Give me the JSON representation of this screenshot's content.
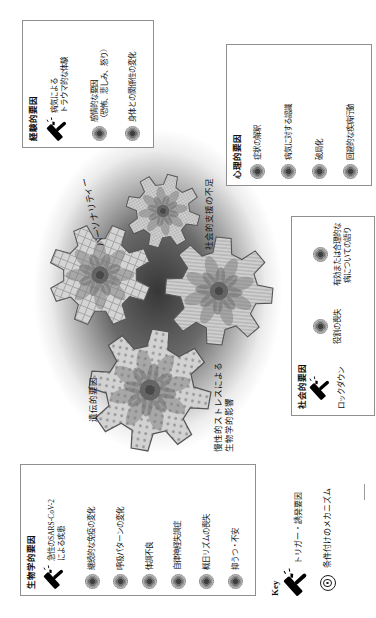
{
  "figure": {
    "boxes": {
      "biological": {
        "title": "生物学的要因",
        "items": [
          {
            "icon": "hammer",
            "lines": [
              "急性のSARS-CoV-2",
              "による疾患"
            ]
          },
          {
            "icon": "mechanism",
            "lines": [
              "継続的な免疫の変化"
            ]
          },
          {
            "icon": "mechanism",
            "lines": [
              "呼吸パターンの変化"
            ]
          },
          {
            "icon": "mechanism",
            "lines": [
              "体調不良"
            ]
          },
          {
            "icon": "mechanism",
            "lines": [
              "自律神経失調症"
            ]
          },
          {
            "icon": "mechanism",
            "lines": [
              "概日リズムの喪失"
            ]
          },
          {
            "icon": "mechanism",
            "lines": [
              "抑うつ・不安"
            ]
          }
        ]
      },
      "experiential": {
        "title": "経験的要因",
        "items": [
          {
            "icon": "hammer",
            "lines": [
              "病気による",
              "トラウマ的な体験"
            ]
          },
          {
            "icon": "mechanism",
            "lines": [
              "感情的な要因",
              "（恐怖、悲しみ、怒り）"
            ]
          },
          {
            "icon": "mechanism",
            "lines": [
              "身体との関係性の変化"
            ]
          }
        ]
      },
      "psychological": {
        "title": "心理的要因",
        "items": [
          {
            "icon": "mechanism",
            "lines": [
              "症状の解釈"
            ]
          },
          {
            "icon": "mechanism",
            "lines": [
              "病気に対する認識"
            ]
          },
          {
            "icon": "mechanism",
            "lines": [
              "破局化"
            ]
          },
          {
            "icon": "mechanism",
            "lines": [
              "回避的な疾病行動"
            ]
          }
        ]
      },
      "social": {
        "title": "社会的要因",
        "items": [
          {
            "icon": "hammer",
            "lines": [
              "ロックダウン"
            ]
          },
          {
            "icon": "mechanism",
            "lines": [
              "役割の喪失"
            ]
          },
          {
            "icon": "mechanism",
            "lines": [
              "有効または合理的な",
              "病についての語り"
            ]
          }
        ]
      }
    },
    "gears": {
      "genetic": {
        "label": "遺伝的要因",
        "pattern": "dots"
      },
      "personality": {
        "label": "パーソナリティー",
        "pattern": "crosshatch"
      },
      "social_support": {
        "label": "社会的支援の不足",
        "pattern": "vlines"
      },
      "chronic_stress": {
        "lines": [
          "慢性的ストレスによる",
          "生物学的影響"
        ],
        "pattern": "grid"
      }
    },
    "key": {
      "title": "Key",
      "items": [
        {
          "icon": "hammer",
          "label": "トリガー・誘発要因"
        },
        {
          "icon": "mechanism",
          "label": "条件付けのメカニズム"
        }
      ]
    },
    "colors": {
      "ink": "#111111",
      "box_border": "#8f8f8f",
      "gear_fill": "#d0d0d0",
      "gear_outline": "#555555",
      "shadow": "#3a3a3a"
    }
  }
}
